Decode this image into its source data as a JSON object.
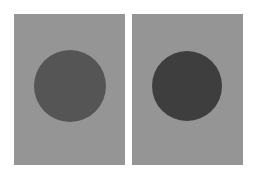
{
  "image": {
    "description": "Two gray rectangular panels side by side, each containing a dark gray filled circle",
    "background": "#ffffff",
    "panels": [
      {
        "name": "left",
        "x": 14,
        "y": 14,
        "w": 111,
        "h": 151,
        "color": "#959595",
        "circle": {
          "cx": 70,
          "cy": 86,
          "r": 36,
          "color": "#555555"
        }
      },
      {
        "name": "right",
        "x": 132,
        "y": 14,
        "w": 111,
        "h": 151,
        "color": "#959595",
        "circle": {
          "cx": 187,
          "cy": 86,
          "r": 35,
          "color": "#3e3e3e"
        }
      }
    ]
  }
}
